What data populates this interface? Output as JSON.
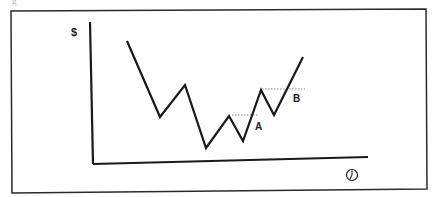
{
  "chart_data": {
    "type": "line",
    "title": "",
    "xlabel": "time (clock icon)",
    "ylabel": "$",
    "grid": false,
    "legend": null,
    "x": [
      0,
      1,
      2,
      3,
      4,
      5,
      6,
      7,
      8
    ],
    "series": [
      {
        "name": "price",
        "values": [
          123,
          47,
          79,
          16,
          48,
          23,
          74,
          49,
          107
        ]
      }
    ],
    "annotations": [
      {
        "label": "A",
        "type": "dotted-horizontal",
        "level": 49,
        "description": "resistance at minor peak, broken by rally"
      },
      {
        "label": "B",
        "type": "dotted-horizontal",
        "level": 75,
        "description": "resistance at higher peak, broken by rally"
      }
    ],
    "axis_ranges": {
      "x": [
        0,
        10
      ],
      "y": [
        0,
        140
      ]
    },
    "note": "Schematic price chart with no numeric ticks; values are relative heights above the x-axis in pixels."
  },
  "figure": {
    "caption_fragment": "g",
    "y_axis_symbol": "$",
    "x_axis_icon": "clock-icon",
    "label_a": "A",
    "label_b": "B"
  },
  "geometry": {
    "frame": [
      11,
      9,
      427,
      191
    ],
    "y_axis": [
      90,
      22,
      93,
      164
    ],
    "x_axis": [
      93,
      164,
      368,
      157
    ],
    "price_points": [
      [
        127,
        41
      ],
      [
        160,
        117
      ],
      [
        185,
        85
      ],
      [
        206,
        148
      ],
      [
        229,
        116
      ],
      [
        243,
        141
      ],
      [
        261,
        90
      ],
      [
        274,
        115
      ],
      [
        303,
        57
      ]
    ],
    "dotted_a": [
      232,
      115,
      258,
      115
    ],
    "dotted_b": [
      262,
      89,
      305,
      89
    ]
  },
  "colors": {
    "ink": "#1a1a1a",
    "frame": "#2b2b2b",
    "dotted": "#8a8a8a",
    "background": "#ffffff"
  }
}
